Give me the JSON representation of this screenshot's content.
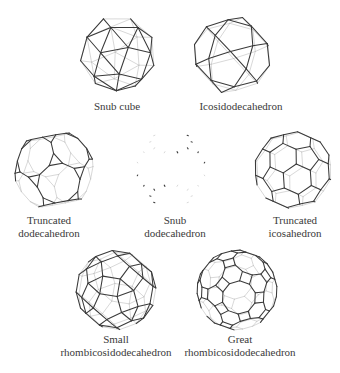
{
  "figure": {
    "background": "#ffffff",
    "front_edge_color": "#3a3a3a",
    "back_edge_color": "#bdbdbd"
  },
  "solids": [
    {
      "id": "snub-cube",
      "label_lines": [
        "Snub cube"
      ],
      "center": [
        118,
        54
      ],
      "radius": 38,
      "rotation": [
        0.35,
        0.55,
        0.1
      ],
      "label_pos": [
        117,
        100
      ]
    },
    {
      "id": "icosidodecahedron",
      "label_lines": [
        "Icosidodecahedron"
      ],
      "center": [
        232,
        55
      ],
      "radius": 39,
      "rotation": [
        0.45,
        0.3,
        0.25
      ],
      "label_pos": [
        241,
        100
      ]
    },
    {
      "id": "truncated-dodecahedron",
      "label_lines": [
        "Truncated",
        "dodecahedron"
      ],
      "center": [
        54,
        170
      ],
      "radius": 40,
      "rotation": [
        0.5,
        0.7,
        0.15
      ],
      "label_pos": [
        49,
        214
      ]
    },
    {
      "id": "snub-dodecahedron",
      "label_lines": [
        "Snub",
        "dodecahedron"
      ],
      "center": [
        171,
        169
      ],
      "radius": 38,
      "rotation": [
        0.0,
        0.0,
        0.0
      ],
      "label_pos": [
        175,
        214
      ]
    },
    {
      "id": "truncated-icosahedron",
      "label_lines": [
        "Truncated",
        "icosahedron"
      ],
      "center": [
        293,
        170
      ],
      "radius": 39,
      "rotation": [
        0.3,
        0.45,
        0.2
      ],
      "label_pos": [
        295,
        214
      ]
    },
    {
      "id": "small-rhombicosidodecahedron",
      "label_lines": [
        "Small",
        "rhombicosidodecahedron"
      ],
      "center": [
        116,
        290
      ],
      "radius": 40,
      "rotation": [
        0.4,
        0.2,
        0.35
      ],
      "label_pos": [
        116,
        333
      ]
    },
    {
      "id": "great-rhombicosidodecahedron",
      "label_lines": [
        "Great",
        "rhombicosidodecahedron"
      ],
      "center": [
        237,
        290
      ],
      "radius": 40,
      "rotation": [
        0.25,
        0.6,
        0.1
      ],
      "label_pos": [
        240,
        333
      ]
    }
  ]
}
